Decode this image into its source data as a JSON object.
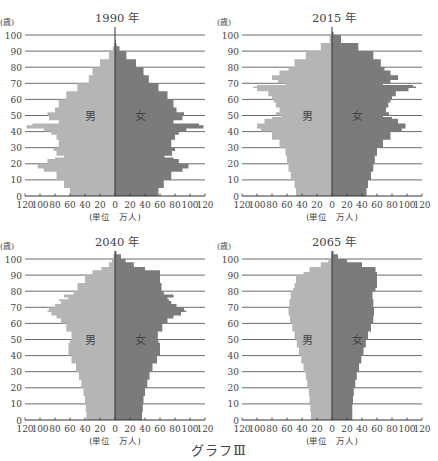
{
  "caption": "グラフⅢ",
  "colors": {
    "male": "#b5b5b5",
    "female": "#7b7b7b",
    "grid": "#5a5a5a",
    "axis": "#333333",
    "text": "#444444"
  },
  "chart_data": [
    {
      "type": "bar",
      "subtype": "population-pyramid",
      "title": "1990 年",
      "ylabel": "(歳)",
      "xlabel": "(単位　万人)",
      "left_label": "男",
      "right_label": "女",
      "yticks": [
        0,
        10,
        20,
        30,
        40,
        50,
        60,
        70,
        80,
        90,
        100
      ],
      "xticks": [
        "120",
        "100",
        "80",
        "60",
        "40",
        "20",
        "0",
        "20",
        "40",
        "60",
        "80",
        "100",
        "120"
      ],
      "xlim": [
        -120,
        120
      ],
      "ylim": [
        0,
        100
      ],
      "grid": true,
      "ages": [
        0,
        5,
        10,
        15,
        17,
        20,
        23,
        24,
        25,
        28,
        30,
        35,
        38,
        40,
        42,
        44,
        45,
        47,
        50,
        52,
        55,
        60,
        65,
        70,
        75,
        80,
        85,
        90,
        93,
        95
      ],
      "series": [
        {
          "name": "男",
          "values": [
            60,
            68,
            78,
            95,
            103,
            90,
            80,
            68,
            78,
            82,
            75,
            78,
            85,
            95,
            118,
            110,
            75,
            88,
            90,
            80,
            75,
            65,
            50,
            35,
            30,
            20,
            8,
            3,
            1,
            0
          ]
        },
        {
          "name": "女",
          "values": [
            58,
            65,
            75,
            90,
            98,
            85,
            78,
            66,
            76,
            80,
            75,
            80,
            85,
            95,
            118,
            112,
            78,
            90,
            92,
            82,
            78,
            70,
            58,
            45,
            38,
            28,
            15,
            6,
            2,
            1
          ]
        }
      ]
    },
    {
      "type": "bar",
      "subtype": "population-pyramid",
      "title": "2015 年",
      "ylabel": "(歳)",
      "xlabel": "(単位　万人)",
      "left_label": "男",
      "right_label": "女",
      "yticks": [
        0,
        10,
        20,
        30,
        40,
        50,
        60,
        70,
        80,
        90,
        100
      ],
      "xticks": [
        "120",
        "100",
        "80",
        "60",
        "40",
        "20",
        "0",
        "20",
        "40",
        "60",
        "80",
        "100",
        "120"
      ],
      "xlim": [
        -120,
        120
      ],
      "ylim": [
        0,
        100
      ],
      "grid": true,
      "ages": [
        0,
        5,
        10,
        15,
        20,
        25,
        30,
        35,
        40,
        42,
        45,
        48,
        49,
        50,
        52,
        55,
        58,
        60,
        62,
        65,
        67,
        68,
        69,
        70,
        72,
        75,
        78,
        80,
        85,
        90,
        95,
        100
      ],
      "series": [
        {
          "name": "男",
          "values": [
            48,
            50,
            55,
            58,
            60,
            62,
            70,
            80,
            95,
            100,
            90,
            80,
            68,
            75,
            70,
            75,
            78,
            80,
            85,
            100,
            105,
            100,
            62,
            72,
            80,
            70,
            58,
            50,
            35,
            15,
            3,
            0
          ]
        },
        {
          "name": "女",
          "values": [
            46,
            48,
            52,
            55,
            57,
            60,
            68,
            78,
            93,
            98,
            88,
            80,
            68,
            76,
            72,
            75,
            78,
            80,
            85,
            102,
            112,
            108,
            68,
            78,
            88,
            78,
            70,
            65,
            55,
            35,
            12,
            2
          ]
        }
      ]
    },
    {
      "type": "bar",
      "subtype": "population-pyramid",
      "title": "2040 年",
      "ylabel": "(歳)",
      "xlabel": "(単位　万人)",
      "left_label": "男",
      "right_label": "女",
      "yticks": [
        0,
        10,
        20,
        30,
        40,
        50,
        60,
        70,
        80,
        90,
        100
      ],
      "xticks": [
        "120",
        "100",
        "80",
        "60",
        "40",
        "20",
        "0",
        "20",
        "40",
        "60",
        "80",
        "100",
        "120"
      ],
      "xlim": [
        -120,
        120
      ],
      "ylim": [
        0,
        100
      ],
      "grid": true,
      "ages": [
        0,
        5,
        10,
        15,
        20,
        25,
        30,
        35,
        40,
        45,
        48,
        50,
        55,
        60,
        63,
        65,
        67,
        68,
        70,
        72,
        74,
        75,
        76,
        78,
        80,
        85,
        90,
        93,
        95,
        98,
        100,
        103
      ],
      "series": [
        {
          "name": "男",
          "values": [
            38,
            39,
            40,
            42,
            45,
            48,
            52,
            58,
            62,
            62,
            60,
            58,
            65,
            72,
            78,
            85,
            90,
            88,
            80,
            72,
            75,
            62,
            68,
            55,
            50,
            40,
            30,
            18,
            8,
            4,
            2,
            0
          ]
        },
        {
          "name": "女",
          "values": [
            36,
            37,
            38,
            40,
            43,
            46,
            50,
            56,
            60,
            60,
            58,
            57,
            63,
            70,
            78,
            88,
            95,
            92,
            82,
            75,
            72,
            70,
            78,
            65,
            62,
            60,
            60,
            40,
            25,
            14,
            8,
            2
          ]
        }
      ]
    },
    {
      "type": "bar",
      "subtype": "population-pyramid",
      "title": "2065 年",
      "ylabel": "(歳)",
      "xlabel": "(単位　万人)",
      "left_label": "男",
      "right_label": "女",
      "yticks": [
        0,
        10,
        20,
        30,
        40,
        50,
        60,
        70,
        80,
        90,
        100
      ],
      "xticks": [
        "120",
        "100",
        "80",
        "60",
        "40",
        "20",
        "0",
        "20",
        "40",
        "60",
        "80",
        "100",
        "120"
      ],
      "xlim": [
        -120,
        120
      ],
      "ylim": [
        0,
        100
      ],
      "grid": true,
      "ages": [
        0,
        5,
        10,
        15,
        20,
        25,
        30,
        35,
        40,
        45,
        50,
        55,
        60,
        65,
        70,
        75,
        80,
        82,
        85,
        90,
        92,
        95,
        98,
        100,
        103
      ],
      "series": [
        {
          "name": "男",
          "values": [
            28,
            29,
            30,
            31,
            33,
            35,
            38,
            41,
            44,
            47,
            50,
            53,
            56,
            58,
            57,
            55,
            52,
            50,
            48,
            38,
            30,
            15,
            5,
            1,
            0
          ]
        },
        {
          "name": "女",
          "values": [
            27,
            27,
            28,
            29,
            31,
            33,
            36,
            39,
            42,
            45,
            48,
            52,
            55,
            56,
            55,
            54,
            58,
            60,
            60,
            60,
            58,
            40,
            20,
            8,
            2
          ]
        }
      ]
    }
  ]
}
